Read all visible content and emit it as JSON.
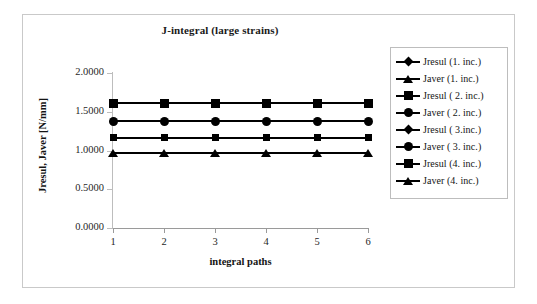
{
  "chart_data": {
    "type": "line",
    "title": "J-integral (large strains)",
    "xlabel": "integral paths",
    "ylabel": "Jresul, Javer [N/mm]",
    "x": [
      1,
      2,
      3,
      4,
      5,
      6
    ],
    "x_tick_labels": [
      "1",
      "2",
      "3",
      "4",
      "5",
      "6"
    ],
    "y_tick_labels": [
      "0.0000",
      "0.5000",
      "1.0000",
      "1.5000",
      "2.0000"
    ],
    "y_tick_values": [
      0.0,
      0.5,
      1.0,
      1.5,
      2.0
    ],
    "ylim": [
      0.0,
      2.0
    ],
    "xlim": [
      1,
      6
    ],
    "grid": false,
    "legend_position": "right",
    "series": [
      {
        "name": "Jresul (1. inc.)",
        "marker": "diamond",
        "color": "#000000",
        "values": [
          0.9678,
          0.9678,
          0.9678,
          0.9678,
          0.9678,
          0.9678
        ]
      },
      {
        "name": "Javer  (1. inc.)",
        "marker": "triangle",
        "color": "#000000",
        "values": [
          0.9678,
          0.9678,
          0.9678,
          0.9678,
          0.9678,
          0.9678
        ]
      },
      {
        "name": "Jresul ( 2. inc.)",
        "marker": "square",
        "color": "#000000",
        "values": [
          1.1613,
          1.1613,
          1.1613,
          1.1613,
          1.1613,
          1.1613
        ]
      },
      {
        "name": "Javer  ( 2. inc.)",
        "marker": "circle",
        "color": "#000000",
        "values": [
          1.1613,
          1.1613,
          1.1613,
          1.1613,
          1.1613,
          1.1613
        ]
      },
      {
        "name": "Jresul ( 3.inc.)",
        "marker": "diamond",
        "color": "#000000",
        "values": [
          1.3806,
          1.3806,
          1.3806,
          1.3806,
          1.3806,
          1.3806
        ]
      },
      {
        "name": "Javer  ( 3. inc.)",
        "marker": "circle",
        "color": "#000000",
        "values": [
          1.3806,
          1.3806,
          1.3806,
          1.3806,
          1.3806,
          1.3806
        ]
      },
      {
        "name": "Jresul  (4. inc.)",
        "marker": "square",
        "color": "#000000",
        "values": [
          1.6129,
          1.6129,
          1.6129,
          1.6129,
          1.6129,
          1.6129
        ]
      },
      {
        "name": "Javer  (4. inc.)",
        "marker": "triangle",
        "color": "#000000",
        "values": [
          1.6129,
          1.6129,
          1.6129,
          1.6129,
          1.6129,
          1.6129
        ]
      }
    ],
    "drawn_lines": [
      {
        "label": "Jresul  (4. inc.) / Javer  (4. inc.)",
        "marker": "square",
        "value": 1.6129
      },
      {
        "label": "Jresul ( 3.inc.) / Javer  ( 3. inc.)",
        "marker": "circle",
        "value": 1.3806
      },
      {
        "label": "Jresul ( 2. inc.) / Javer  ( 2. inc.)",
        "marker": "square-sm",
        "value": 1.1613
      },
      {
        "label": "Jresul (1. inc.) / Javer  (1. inc.)",
        "marker": "triangle",
        "value": 0.9678
      }
    ]
  }
}
